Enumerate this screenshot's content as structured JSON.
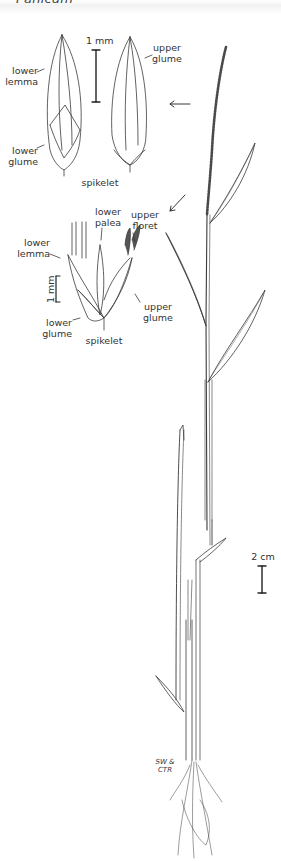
{
  "header": {
    "title": "Panicum"
  },
  "figure_top": {
    "scale_label": "1 mm",
    "labels": {
      "lower_lemma": "lower\nlemma",
      "lower_glume": "lower\nglume",
      "upper_glume": "upper\nglume",
      "caption": "spikelet"
    }
  },
  "figure_mid": {
    "scale_label": "1 mm",
    "labels": {
      "lower_palea": "lower\npalea",
      "upper_floret": "upper\nfloret",
      "lower_lemma": "lower\nlemma",
      "upper_glume": "upper\nglume",
      "lower_glume": "lower\nglume",
      "caption": "spikelet"
    }
  },
  "plant": {
    "scale_label": "2 cm",
    "signature": "SW & CTR"
  },
  "colors": {
    "ink": "#333333",
    "background": "#ffffff",
    "header_band": "#f2f2f2"
  }
}
